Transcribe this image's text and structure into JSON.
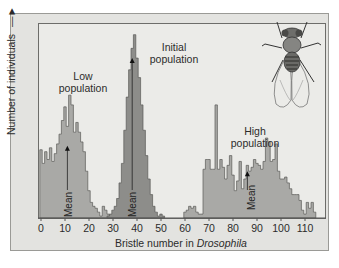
{
  "chart_data": {
    "type": "bar",
    "title": "",
    "xlabel": "Bristle number in Drosophila",
    "xlabel_plain": "Bristle number in ",
    "xlabel_italic": "Drosophila",
    "ylabel": "Number of individuals",
    "ylabel_arrow": "→",
    "xlim": [
      -1,
      116
    ],
    "ylim": [
      0,
      100
    ],
    "x_ticks": [
      0,
      10,
      20,
      30,
      40,
      50,
      60,
      70,
      80,
      90,
      100,
      110
    ],
    "grid": false,
    "legend": "none",
    "annotations": [
      {
        "text": "Low\npopulation",
        "x": 12,
        "y": 72
      },
      {
        "text": "Initial\npopulation",
        "x": 48,
        "y": 93
      },
      {
        "text": "High\npopulation",
        "x": 90,
        "y": 40
      },
      {
        "text": "Mean",
        "x": 11,
        "y": 5,
        "arrow_to_y": 37
      },
      {
        "text": "Mean",
        "x": 38,
        "y": 5,
        "arrow_to_y": 82
      },
      {
        "text": "Mean",
        "x": 86,
        "y": 5,
        "arrow_to_y": 24
      }
    ],
    "series": [
      {
        "name": "Low population",
        "color": "#a9a9a6",
        "x": [
          0,
          1,
          2,
          3,
          4,
          5,
          6,
          7,
          8,
          9,
          10,
          11,
          12,
          13,
          14,
          15,
          16,
          17,
          18,
          19,
          20,
          21,
          22,
          23,
          24,
          25,
          26,
          27,
          28,
          29
        ],
        "values": [
          35,
          28,
          34,
          30,
          36,
          29,
          33,
          38,
          43,
          50,
          57,
          47,
          63,
          58,
          44,
          49,
          44,
          39,
          34,
          24,
          14,
          8,
          6,
          5,
          3,
          1,
          6,
          4,
          2,
          1
        ]
      },
      {
        "name": "Initial population",
        "color": "#8d8d8a",
        "x": [
          28,
          29,
          30,
          31,
          32,
          33,
          34,
          35,
          36,
          37,
          38,
          39,
          40,
          41,
          42,
          43,
          44,
          45,
          46,
          47,
          48,
          49,
          50,
          51
        ],
        "values": [
          1,
          2,
          4,
          6,
          10,
          18,
          28,
          45,
          62,
          76,
          87,
          94,
          82,
          72,
          58,
          45,
          32,
          20,
          12,
          6,
          3,
          1,
          2,
          1
        ]
      },
      {
        "name": "High population",
        "color": "#a9a9a6",
        "x": [
          60,
          61,
          62,
          63,
          64,
          65,
          66,
          67,
          68,
          69,
          70,
          71,
          72,
          73,
          74,
          75,
          76,
          77,
          78,
          79,
          80,
          81,
          82,
          83,
          84,
          85,
          86,
          87,
          88,
          89,
          90,
          91,
          92,
          93,
          94,
          95,
          96,
          97,
          98,
          99,
          100,
          101,
          102,
          103,
          104,
          105,
          106,
          107,
          108,
          109,
          110,
          111,
          112,
          113,
          114
        ],
        "values": [
          3,
          4,
          6,
          5,
          6,
          3,
          2,
          2,
          25,
          30,
          30,
          25,
          25,
          58,
          25,
          30,
          26,
          20,
          27,
          32,
          22,
          14,
          19,
          29,
          15,
          20,
          27,
          24,
          26,
          30,
          28,
          27,
          25,
          29,
          41,
          39,
          29,
          30,
          38,
          24,
          20,
          20,
          21,
          18,
          15,
          12,
          12,
          12,
          9,
          4,
          2,
          8,
          5,
          8,
          3
        ]
      }
    ]
  },
  "labels": {
    "low": [
      "Low",
      "population"
    ],
    "initial": [
      "Initial",
      "population"
    ],
    "high": [
      "High",
      "population"
    ],
    "mean": "Mean"
  },
  "illustration": "fruit-fly-drawing"
}
